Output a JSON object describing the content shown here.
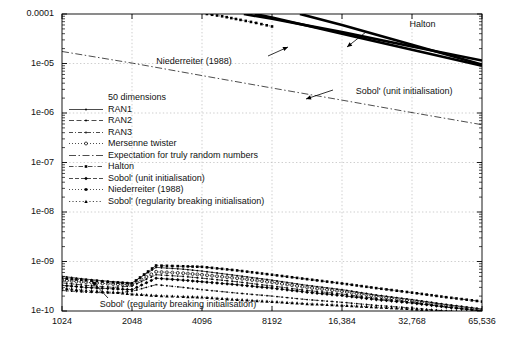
{
  "chart_data": {
    "type": "line",
    "title": "",
    "subtitle": "",
    "xlabel": "",
    "ylabel": "",
    "xscale": "log2",
    "yscale": "log10",
    "xlim": [
      1024,
      65536
    ],
    "ylim": [
      1e-10,
      0.0001
    ],
    "grid": true,
    "legend_position": "center-left",
    "xticks": [
      1024,
      2048,
      4096,
      8192,
      16384,
      32768,
      65536
    ],
    "xtick_labels": [
      "1024",
      "2048",
      "4096",
      "8192",
      "16,384",
      "32,768",
      "65,536"
    ],
    "yticks": [
      0.0001,
      1e-05,
      1e-06,
      1e-07,
      1e-08,
      1e-09,
      1e-10
    ],
    "ytick_labels": [
      "0.0001",
      "1e-05",
      "1e-06",
      "1e-07",
      "1e-08",
      "1e-09",
      "1e-10"
    ],
    "legend_title": "50 dimensions",
    "legend": [
      {
        "label": "RAN1",
        "style": "solid-dot"
      },
      {
        "label": "RAN2",
        "style": "dashed-dot"
      },
      {
        "label": "RAN3",
        "style": "dashdot-dot"
      },
      {
        "label": "Mersenne twister",
        "style": "dotted-circle"
      },
      {
        "label": "Expectation for truly random numbers",
        "style": "long-dashdot"
      },
      {
        "label": "Halton",
        "style": "dashdot-square"
      },
      {
        "label": "Sobol' (unit initialisation)",
        "style": "dashed-diamond"
      },
      {
        "label": "Niederreiter (1988)",
        "style": "dotted-square"
      },
      {
        "label": "Sobol' (regularity breaking initialisation)",
        "style": "dotted-tri"
      }
    ],
    "annotations": [
      {
        "text": "Halton",
        "x": 0.8,
        "y": 0.055
      },
      {
        "text": "Niederreiter (1988)",
        "x": 0.305,
        "y": 0.165
      },
      {
        "text": "Sobol' (unit initialisation)",
        "x": 0.695,
        "y": 0.255
      },
      {
        "text": "Sobol' (regularity breaking initialisation)",
        "x": 0.195,
        "y": 0.885
      }
    ],
    "series": [
      {
        "name": "Expectation for truly random numbers",
        "style": "long-dashdot",
        "points": [
          [
            1024,
            1.75e-05
          ],
          [
            2048,
            1.02e-05
          ],
          [
            4096,
            5.7e-06
          ],
          [
            8192,
            3.2e-06
          ],
          [
            16384,
            1.82e-06
          ],
          [
            32768,
            1.02e-06
          ],
          [
            65536,
            5.8e-07
          ]
        ]
      },
      {
        "name": "Halton",
        "style": "thick-solid",
        "points": [
          [
            6200,
            0.0001
          ],
          [
            8192,
            8e-05
          ],
          [
            16384,
            4.3e-05
          ],
          [
            32768,
            2.2e-05
          ],
          [
            65536,
            1.15e-05
          ]
        ]
      },
      {
        "name": "Niederreiter (1988)",
        "style": "thick-solid",
        "points": [
          [
            6900,
            0.0001
          ],
          [
            8192,
            8.5e-05
          ],
          [
            16384,
            4e-05
          ],
          [
            32768,
            1.9e-05
          ],
          [
            65536,
            9e-06
          ]
        ]
      },
      {
        "name": "Sobol' (unit initialisation)",
        "style": "thick-solid",
        "points": [
          [
            10800,
            0.0001
          ],
          [
            16384,
            6e-05
          ],
          [
            32768,
            2.4e-05
          ],
          [
            65536,
            9.5e-06
          ]
        ]
      },
      {
        "name": "Niederreiter-dotted-upper",
        "style": "dotted-square",
        "points": [
          [
            4300,
            0.0001
          ],
          [
            5000,
            9e-05
          ],
          [
            6000,
            7.6e-05
          ],
          [
            7000,
            6.6e-05
          ],
          [
            8192,
            5.6e-05
          ]
        ]
      },
      {
        "name": "RAN1",
        "style": "solid-dot",
        "points": [
          [
            1024,
            5e-10
          ],
          [
            1300,
            4.4e-10
          ],
          [
            1700,
            3.9e-10
          ],
          [
            2048,
            3.7e-10
          ],
          [
            2600,
            7.6e-10
          ],
          [
            3400,
            7e-10
          ],
          [
            4096,
            6.4e-10
          ],
          [
            5800,
            5.2e-10
          ],
          [
            8192,
            4.2e-10
          ],
          [
            11600,
            3.3e-10
          ],
          [
            16384,
            2.7e-10
          ],
          [
            23000,
            2.1e-10
          ],
          [
            32768,
            1.7e-10
          ],
          [
            46000,
            1.35e-10
          ],
          [
            65536,
            1.1e-10
          ]
        ]
      },
      {
        "name": "RAN2",
        "style": "dashed-dot",
        "points": [
          [
            1024,
            3.7e-10
          ],
          [
            1300,
            3.3e-10
          ],
          [
            1700,
            3e-10
          ],
          [
            2048,
            3.2e-10
          ],
          [
            2600,
            5.4e-10
          ],
          [
            3400,
            5e-10
          ],
          [
            4096,
            4.6e-10
          ],
          [
            5800,
            3.9e-10
          ],
          [
            8192,
            3.2e-10
          ],
          [
            11600,
            2.6e-10
          ],
          [
            16384,
            2.2e-10
          ],
          [
            23000,
            1.8e-10
          ],
          [
            32768,
            1.5e-10
          ],
          [
            46000,
            1.2e-10
          ],
          [
            65536,
            1e-10
          ]
        ]
      },
      {
        "name": "RAN3",
        "style": "dashdot-dot",
        "points": [
          [
            1024,
            2.6e-10
          ],
          [
            1300,
            2.4e-10
          ],
          [
            1700,
            2.3e-10
          ],
          [
            2048,
            2.5e-10
          ],
          [
            2600,
            3.4e-10
          ],
          [
            3400,
            3e-10
          ],
          [
            4096,
            2.7e-10
          ],
          [
            5800,
            2.3e-10
          ],
          [
            8192,
            2e-10
          ],
          [
            11600,
            1.7e-10
          ],
          [
            16384,
            1.5e-10
          ],
          [
            23000,
            1.3e-10
          ],
          [
            32768,
            1.15e-10
          ],
          [
            46000,
            1e-10
          ],
          [
            65536,
            9e-11
          ]
        ]
      },
      {
        "name": "Mersenne twister",
        "style": "dotted-circle",
        "points": [
          [
            1024,
            4.2e-10
          ],
          [
            1300,
            3.8e-10
          ],
          [
            1700,
            3.5e-10
          ],
          [
            2048,
            3.4e-10
          ],
          [
            2600,
            6.2e-10
          ],
          [
            3400,
            5.8e-10
          ],
          [
            4096,
            5.4e-10
          ],
          [
            5800,
            4.6e-10
          ],
          [
            8192,
            3.8e-10
          ],
          [
            11600,
            3e-10
          ],
          [
            16384,
            2.5e-10
          ],
          [
            23000,
            2e-10
          ],
          [
            32768,
            1.6e-10
          ],
          [
            46000,
            1.3e-10
          ],
          [
            65536,
            1.05e-10
          ]
        ]
      },
      {
        "name": "Sobol' (regularity breaking initialisation)",
        "style": "dotted-tri",
        "points": [
          [
            1024,
            2.9e-10
          ],
          [
            1300,
            2.6e-10
          ],
          [
            1700,
            2.4e-10
          ],
          [
            2048,
            2.2e-10
          ],
          [
            2600,
            2.05e-10
          ],
          [
            3400,
            1.95e-10
          ],
          [
            4096,
            1.9e-10
          ],
          [
            5800,
            1.7e-10
          ],
          [
            8192,
            1.55e-10
          ],
          [
            11600,
            1.4e-10
          ],
          [
            16384,
            1.3e-10
          ],
          [
            23000,
            1.2e-10
          ],
          [
            32768,
            1.1e-10
          ],
          [
            46000,
            1e-10
          ],
          [
            65536,
            9.5e-11
          ]
        ]
      },
      {
        "name": "Halton-low",
        "style": "dashdot-square",
        "points": [
          [
            1024,
            4.6e-10
          ],
          [
            1300,
            4.2e-10
          ],
          [
            1700,
            3.8e-10
          ],
          [
            2048,
            3.6e-10
          ],
          [
            2600,
            8.3e-10
          ],
          [
            3400,
            8e-10
          ],
          [
            4096,
            7.8e-10
          ],
          [
            5800,
            6.6e-10
          ],
          [
            8192,
            5.4e-10
          ],
          [
            11600,
            4.4e-10
          ],
          [
            16384,
            3.6e-10
          ],
          [
            23000,
            2.9e-10
          ],
          [
            32768,
            2.35e-10
          ],
          [
            46000,
            1.9e-10
          ],
          [
            65536,
            1.55e-10
          ]
        ]
      },
      {
        "name": "Sobol-unit-low",
        "style": "dashed-diamond",
        "points": [
          [
            1024,
            3.3e-10
          ],
          [
            1300,
            3e-10
          ],
          [
            1700,
            2.8e-10
          ],
          [
            2048,
            2.7e-10
          ],
          [
            2600,
            4.6e-10
          ],
          [
            3400,
            4.2e-10
          ],
          [
            4096,
            3.9e-10
          ],
          [
            5800,
            3.4e-10
          ],
          [
            8192,
            2.9e-10
          ],
          [
            11600,
            2.4e-10
          ],
          [
            16384,
            2.05e-10
          ],
          [
            23000,
            1.7e-10
          ],
          [
            32768,
            1.45e-10
          ],
          [
            46000,
            1.2e-10
          ],
          [
            65536,
            1e-10
          ]
        ]
      }
    ]
  }
}
